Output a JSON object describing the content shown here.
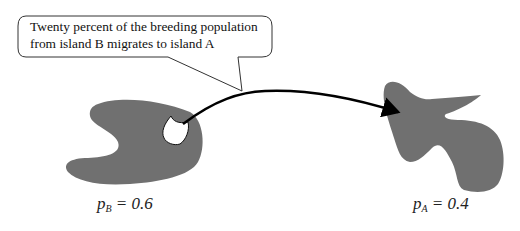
{
  "callout": {
    "line1": "Twenty percent of the breeding population",
    "line2": "from island B migrates to island A"
  },
  "islands": {
    "b": {
      "name": "island B",
      "var": "p",
      "sub": "B",
      "eq": " = 0.6"
    },
    "a": {
      "name": "island A",
      "var": "p",
      "sub": "A",
      "eq": " = 0.4"
    }
  },
  "colors": {
    "island_fill": "#707070",
    "subpopulation_fill": "#ffffff",
    "arrow": "#000000",
    "callout_stroke": "#333333"
  }
}
